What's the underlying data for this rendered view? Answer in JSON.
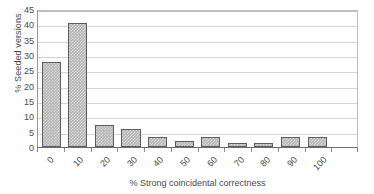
{
  "chart_data": {
    "type": "bar",
    "title": "",
    "xlabel": "% Strong coincidental correctness",
    "ylabel": "% Seeded versions",
    "categories": [
      "0",
      "10",
      "20",
      "30",
      "40",
      "50",
      "60",
      "70",
      "80",
      "90",
      "100"
    ],
    "values": [
      27.6,
      40.5,
      7.3,
      6.0,
      3.4,
      2.1,
      3.4,
      1.3,
      1.3,
      3.4,
      3.4
    ],
    "ylim": [
      0,
      45
    ],
    "ytick_step": 5,
    "yticks": [
      "0",
      "5",
      "10",
      "15",
      "20",
      "25",
      "30",
      "35",
      "40",
      "45"
    ],
    "grid": true,
    "grid_axis": "y",
    "legend": false,
    "legend_position": "none",
    "bar_fill_color": "#b6b6b6",
    "bar_border_color": "#5d5d5d",
    "gridline_color": "#d4d4d4",
    "axis_color": "#6e6e6e",
    "text_color": "#4a4a4a",
    "background_color": "#ffffff",
    "xtick_label_rotation": -45
  }
}
